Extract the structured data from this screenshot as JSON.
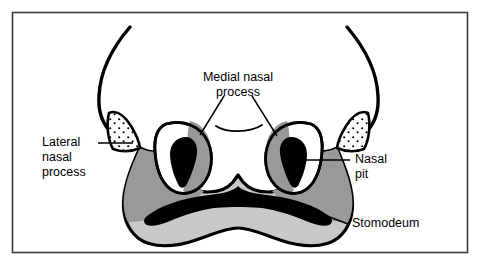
{
  "figure": {
    "frame": {
      "border_color": "#3a3a3a",
      "background": "#ffffff"
    },
    "colors": {
      "outline": "#000000",
      "fill_black": "#000000",
      "fill_white": "#ffffff",
      "fill_mid_gray": "#999999",
      "fill_light_gray": "#c8c8c8",
      "stipple_dot": "#000000",
      "leader_line": "#000000"
    },
    "labels": [
      {
        "id": "medial-nasal-process",
        "lines": [
          "Medial nasal",
          "process"
        ],
        "align": "center",
        "x": 238,
        "y": 78,
        "line_height": 15
      },
      {
        "id": "lateral-nasal-process",
        "lines": [
          "Lateral",
          "nasal",
          "process"
        ],
        "align": "left",
        "x": 42,
        "y": 143,
        "line_height": 15
      },
      {
        "id": "nasal-pit",
        "lines": [
          "Nasal",
          "pit"
        ],
        "align": "right",
        "x": 355,
        "y": 160,
        "line_height": 15
      },
      {
        "id": "stomodeum",
        "lines": [
          "Stomodeum"
        ],
        "align": "right",
        "x": 352,
        "y": 224,
        "line_height": 15
      }
    ],
    "structures": [
      {
        "id": "frontonasal-arm-left",
        "name": "left frontonasal prominence arm",
        "fill": "none",
        "stroke": "#000000"
      },
      {
        "id": "frontonasal-arm-right",
        "name": "right frontonasal prominence arm",
        "fill": "none",
        "stroke": "#000000"
      },
      {
        "id": "maxillary-mandibular-mass",
        "name": "maxillary and mandibular prominence mass",
        "fill": "#c8c8c8",
        "stroke": "#000000"
      },
      {
        "id": "maxillary-prominence-left",
        "name": "left maxillary prominence",
        "fill": "#999999",
        "stroke": "none"
      },
      {
        "id": "maxillary-prominence-right",
        "name": "right maxillary prominence",
        "fill": "#999999",
        "stroke": "none"
      },
      {
        "id": "nasal-placode-left",
        "name": "left nasal placode",
        "fill": "#ffffff",
        "stroke": "#000000"
      },
      {
        "id": "nasal-placode-right",
        "name": "right nasal placode",
        "fill": "#ffffff",
        "stroke": "#000000"
      },
      {
        "id": "medial-nasal-process-left",
        "name": "left medial nasal process",
        "fill": "#999999",
        "stroke": "none"
      },
      {
        "id": "medial-nasal-process-right",
        "name": "right medial nasal process",
        "fill": "#999999",
        "stroke": "none"
      },
      {
        "id": "nasal-pit-left",
        "name": "left nasal pit",
        "fill": "#000000",
        "stroke": "none"
      },
      {
        "id": "nasal-pit-right",
        "name": "right nasal pit",
        "fill": "#000000",
        "stroke": "none"
      },
      {
        "id": "lateral-nasal-process-left",
        "name": "left lateral nasal process (stippled)",
        "fill": "#ffffff",
        "stroke": "#000000",
        "pattern": "stipple"
      },
      {
        "id": "lateral-nasal-process-right",
        "name": "right lateral nasal process (stippled)",
        "fill": "#ffffff",
        "stroke": "#000000",
        "pattern": "stipple"
      },
      {
        "id": "stomodeum-opening",
        "name": "stomodeum (primitive mouth)",
        "fill": "#000000",
        "stroke": "none"
      },
      {
        "id": "frontonasal-midline-curve",
        "name": "frontonasal midline curve",
        "fill": "none",
        "stroke": "#000000"
      }
    ]
  }
}
